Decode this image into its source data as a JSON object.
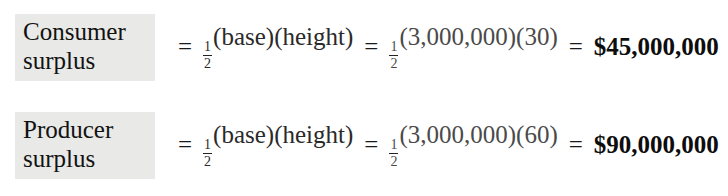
{
  "document": {
    "type": "equation-block",
    "background_color": "#ffffff",
    "label_highlight_color": "#e9e9e7",
    "text_color": "#111111"
  },
  "equations": [
    {
      "label_line_1": "Consumer",
      "label_line_2": "surplus",
      "equals_1": "=",
      "fraction_numerator": "1",
      "fraction_denominator": "2",
      "formula": "(base)(height)",
      "equals_2": "=",
      "numeric_fraction_numerator": "1",
      "numeric_fraction_denominator": "2",
      "numeric_expression": "(3,000,000)(30)",
      "equals_3": "=",
      "result": "$45,000,000"
    },
    {
      "label_line_1": "Producer",
      "label_line_2": "surplus",
      "equals_1": "=",
      "fraction_numerator": "1",
      "fraction_denominator": "2",
      "formula": "(base)(height)",
      "equals_2": "=",
      "numeric_fraction_numerator": "1",
      "numeric_fraction_denominator": "2",
      "numeric_expression": "(3,000,000)(60)",
      "equals_3": "=",
      "result": "$90,000,000"
    }
  ]
}
